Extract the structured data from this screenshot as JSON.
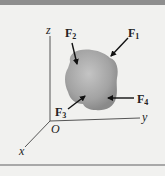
{
  "figure": {
    "type": "free-body force diagram",
    "axes": {
      "x_label": "x",
      "y_label": "y",
      "z_label": "z",
      "origin_label": "O"
    },
    "forces": [
      {
        "id": "F1",
        "symbol": "F",
        "subscript": "1"
      },
      {
        "id": "F2",
        "symbol": "F",
        "subscript": "2"
      },
      {
        "id": "F3",
        "symbol": "F",
        "subscript": "3"
      },
      {
        "id": "F4",
        "symbol": "F",
        "subscript": "4"
      }
    ],
    "colors": {
      "background": "#f1f1ef",
      "top_band": "#8e8e8e",
      "body_fill_center": "#bdbdbd",
      "body_fill_edge": "#8c8c8c",
      "axis": "#444444",
      "arrow": "#111111"
    }
  }
}
